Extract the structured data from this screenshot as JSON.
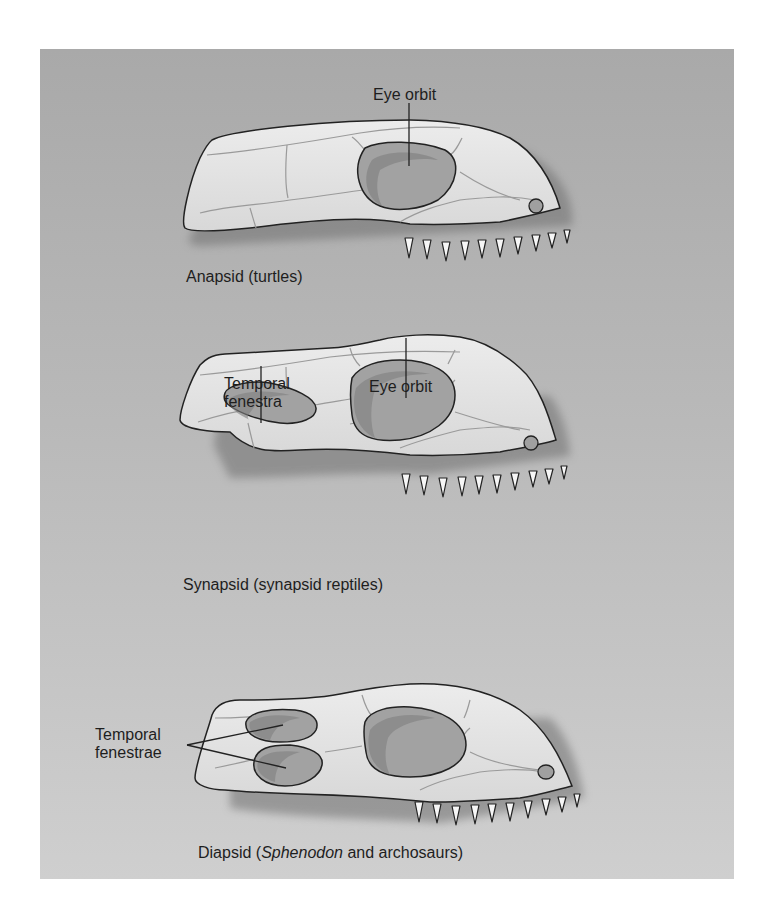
{
  "figure": {
    "background_color": "#b5b5b5",
    "skull_fill": "#e4e4e4",
    "opening_fill": "#9d9d9d",
    "skulls": [
      {
        "id": "anapsid",
        "caption": "Anapsid (turtles)",
        "labels": {
          "eye_orbit": "Eye orbit"
        },
        "temporal_openings": 0
      },
      {
        "id": "synapsid",
        "caption": "Synapsid (synapsid reptiles)",
        "labels": {
          "temporal_line1": "Temporal",
          "temporal_line2": "fenestra",
          "eye_orbit": "Eye orbit"
        },
        "temporal_openings": 1
      },
      {
        "id": "diapsid",
        "caption_prefix": "Diapsid (",
        "caption_italic": "Sphenodon",
        "caption_suffix": " and archosaurs)",
        "labels": {
          "temporal_line1": "Temporal",
          "temporal_line2": "fenestrae"
        },
        "temporal_openings": 2
      }
    ]
  }
}
